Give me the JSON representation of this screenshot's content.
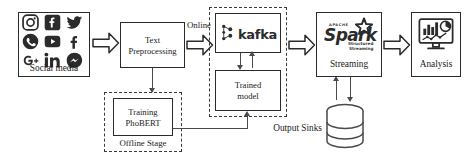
{
  "diagram": {
    "nodes": {
      "social_media": {
        "label": "Social media",
        "icons": [
          "instagram-icon",
          "facebook-icon",
          "twitter-icon",
          "whatsapp-icon",
          "youtube-icon",
          "facebook-f-icon",
          "google-plus-icon",
          "linkedin-icon",
          "messenger-icon"
        ]
      },
      "text_preprocessing": {
        "line1": "Text",
        "line2": "Preprocessing"
      },
      "training": {
        "line1": "Training",
        "line2": "PhoBERT"
      },
      "offline_stage": {
        "label": "Offline Stage"
      },
      "kafka": {
        "label": "kafka"
      },
      "trained_model": {
        "line1": "Trained",
        "line2": "model"
      },
      "spark": {
        "apache": "APACHE",
        "word": "Spark",
        "sub1": "Structured",
        "sub2": "Streaming",
        "label": "Streaming"
      },
      "output_sinks": {
        "label": "Output Sinks"
      },
      "analysis": {
        "label": "Analysis",
        "icon": "dashboard-monitor-icon"
      }
    },
    "edges": {
      "online": {
        "label": "Online"
      }
    },
    "colors": {
      "stroke": "#2b2b2b",
      "connector": "#4a4a4a",
      "dashed": "#3a3a3a",
      "background": "#ffffff"
    }
  }
}
